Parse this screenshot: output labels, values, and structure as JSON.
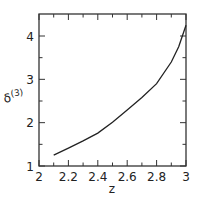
{
  "chart_data": {
    "type": "line",
    "title": "",
    "xlabel": "z",
    "ylabel": "δ(3)",
    "ylabel_base": "δ",
    "ylabel_sup": "(3)",
    "xlim": [
      2,
      3
    ],
    "ylim": [
      1,
      4.4
    ],
    "xticks": [
      2,
      2.2,
      2.4,
      2.6,
      2.8,
      3
    ],
    "xtick_labels": [
      "2",
      "2.2",
      "2.4",
      "2.6",
      "2.8",
      "3"
    ],
    "xminor": [
      2.1,
      2.3,
      2.5,
      2.7,
      2.9
    ],
    "yticks": [
      1,
      2,
      3,
      4
    ],
    "ytick_labels": [
      "1",
      "2",
      "3",
      "4"
    ],
    "yminor": [
      1.5,
      2.5,
      3.5
    ],
    "grid": false,
    "series": [
      {
        "name": "δ(3)",
        "x": [
          2.1,
          2.2,
          2.3,
          2.4,
          2.5,
          2.6,
          2.7,
          2.8,
          2.9,
          2.95,
          3.0
        ],
        "y": [
          1.25,
          1.41,
          1.58,
          1.76,
          2.01,
          2.29,
          2.58,
          2.9,
          3.4,
          3.75,
          4.25
        ]
      }
    ]
  }
}
